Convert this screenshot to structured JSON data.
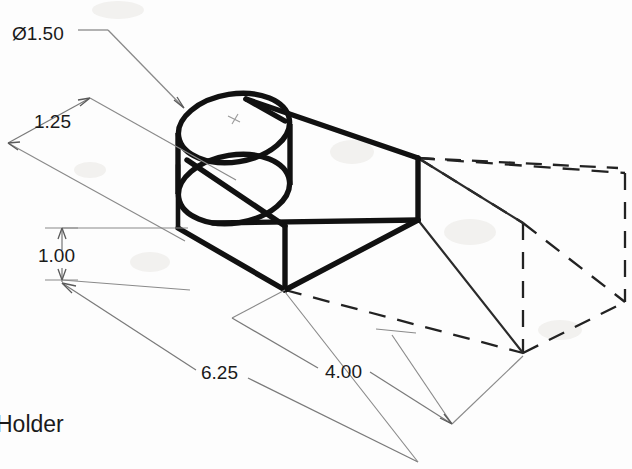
{
  "drawing": {
    "title_label": "Holder",
    "projection": "isometric",
    "background_color": "#fdfdfd",
    "line_color": "#111111",
    "dimension_color": "#7a7a7a"
  },
  "dimensions": [
    {
      "id": "hole-diameter",
      "label": "Ø1.50",
      "value": 1.5,
      "kind": "diameter",
      "feature": "cylindrical-boss",
      "text_x": 12,
      "text_y": 40
    },
    {
      "id": "depth",
      "label": "1.25",
      "value": 1.25,
      "kind": "linear",
      "feature": "boss-offset-depth",
      "text_x": 34,
      "text_y": 128
    },
    {
      "id": "height",
      "label": "1.00",
      "value": 1.0,
      "kind": "linear",
      "feature": "block-height",
      "text_x": 38,
      "text_y": 262
    },
    {
      "id": "overall-length",
      "label": "6.25",
      "value": 6.25,
      "kind": "linear",
      "feature": "overall-length",
      "text_x": 201,
      "text_y": 379
    },
    {
      "id": "block-length",
      "label": "4.00",
      "value": 4.0,
      "kind": "linear",
      "feature": "block-length",
      "text_x": 325,
      "text_y": 378
    }
  ],
  "geometry": {
    "solid_body_name": "holder-block-with-boss",
    "phantom_body_name": "phantom-extension-box",
    "boss_name": "cylindrical-boss"
  }
}
